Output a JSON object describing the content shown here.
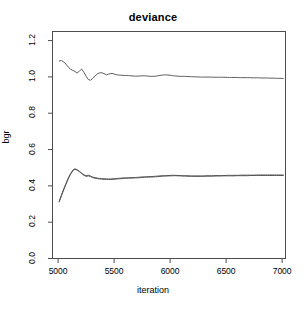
{
  "chart_data": {
    "type": "line",
    "title": "deviance",
    "xlabel": "iteration",
    "ylabel": "bgr",
    "xlim": [
      4950,
      7030
    ],
    "ylim": [
      0.0,
      1.25
    ],
    "grid": false,
    "legend": "none",
    "xticks": [
      5000,
      5500,
      6000,
      6500,
      7000
    ],
    "xtick_labels": [
      "5000",
      "5500",
      "6000",
      "6500",
      "7000"
    ],
    "yticks": [
      0.0,
      0.2,
      0.4,
      0.6,
      0.8,
      1.0,
      1.2
    ],
    "ytick_labels": [
      "0.0",
      "0.2",
      "0.4",
      "0.6",
      "0.8",
      "1.0",
      "1.2"
    ],
    "line_color": "#4d4d4d",
    "axis_color": "#4d4d4d",
    "series": [
      {
        "name": "upper-trace",
        "x": [
          5010,
          5030,
          5050,
          5070,
          5090,
          5110,
          5130,
          5150,
          5170,
          5190,
          5210,
          5230,
          5250,
          5270,
          5290,
          5310,
          5330,
          5350,
          5370,
          5390,
          5410,
          5430,
          5450,
          5470,
          5490,
          5510,
          5530,
          5550,
          5570,
          5590,
          5610,
          5630,
          5650,
          5670,
          5690,
          5710,
          5730,
          5750,
          5770,
          5790,
          5810,
          5830,
          5850,
          5870,
          5890,
          5910,
          5930,
          5950,
          5970,
          5990,
          6010,
          6030,
          6050,
          6070,
          6090,
          6110,
          6130,
          6150,
          6170,
          6190,
          6210,
          6230,
          6250,
          6270,
          6290,
          6310,
          6330,
          6350,
          6370,
          6390,
          6410,
          6430,
          6450,
          6470,
          6490,
          6510,
          6530,
          6550,
          6570,
          6590,
          6610,
          6630,
          6650,
          6670,
          6690,
          6710,
          6730,
          6750,
          6770,
          6790,
          6810,
          6830,
          6850,
          6870,
          6890,
          6910,
          6930,
          6950,
          6970,
          6990,
          7010
        ],
        "values": [
          1.088,
          1.09,
          1.083,
          1.07,
          1.055,
          1.043,
          1.036,
          1.03,
          1.021,
          1.032,
          1.043,
          1.026,
          1.004,
          0.985,
          0.982,
          0.992,
          1.006,
          1.016,
          1.022,
          1.023,
          1.018,
          1.012,
          1.015,
          1.019,
          1.018,
          1.014,
          1.011,
          1.01,
          1.009,
          1.008,
          1.008,
          1.007,
          1.006,
          1.005,
          1.004,
          1.004,
          1.005,
          1.006,
          1.006,
          1.005,
          1.004,
          1.003,
          1.003,
          1.004,
          1.006,
          1.008,
          1.01,
          1.011,
          1.011,
          1.01,
          1.008,
          1.006,
          1.005,
          1.004,
          1.003,
          1.003,
          1.003,
          1.002,
          1.002,
          1.001,
          1.001,
          1.0,
          1.0,
          0.999,
          0.999,
          0.999,
          0.999,
          0.999,
          0.999,
          0.998,
          0.998,
          0.998,
          0.998,
          0.998,
          0.998,
          0.997,
          0.997,
          0.997,
          0.997,
          0.997,
          0.996,
          0.996,
          0.996,
          0.996,
          0.996,
          0.996,
          0.995,
          0.995,
          0.995,
          0.995,
          0.994,
          0.994,
          0.994,
          0.994,
          0.993,
          0.993,
          0.993,
          0.992,
          0.992,
          0.992,
          0.991
        ]
      },
      {
        "name": "lower-trace-a",
        "x": [
          5010,
          5030,
          5050,
          5070,
          5090,
          5110,
          5130,
          5150,
          5170,
          5190,
          5210,
          5230,
          5250,
          5270,
          5290,
          5310,
          5330,
          5350,
          5370,
          5390,
          5410,
          5430,
          5450,
          5470,
          5490,
          5510,
          5530,
          5550,
          5570,
          5590,
          5610,
          5630,
          5650,
          5670,
          5690,
          5710,
          5730,
          5750,
          5770,
          5790,
          5810,
          5830,
          5850,
          5870,
          5890,
          5910,
          5930,
          5950,
          5970,
          5990,
          6010,
          6030,
          6050,
          6070,
          6090,
          6110,
          6130,
          6150,
          6170,
          6190,
          6210,
          6230,
          6250,
          6270,
          6290,
          6310,
          6330,
          6350,
          6370,
          6390,
          6410,
          6430,
          6450,
          6470,
          6490,
          6510,
          6530,
          6550,
          6570,
          6590,
          6610,
          6630,
          6650,
          6670,
          6690,
          6710,
          6730,
          6750,
          6770,
          6790,
          6810,
          6830,
          6850,
          6870,
          6890,
          6910,
          6930,
          6950,
          6970,
          6990,
          7010
        ],
        "values": [
          0.312,
          0.345,
          0.378,
          0.408,
          0.438,
          0.462,
          0.482,
          0.491,
          0.487,
          0.478,
          0.468,
          0.458,
          0.452,
          0.455,
          0.451,
          0.445,
          0.442,
          0.44,
          0.438,
          0.437,
          0.436,
          0.436,
          0.435,
          0.435,
          0.436,
          0.437,
          0.438,
          0.439,
          0.44,
          0.441,
          0.442,
          0.442,
          0.443,
          0.443,
          0.444,
          0.444,
          0.445,
          0.446,
          0.447,
          0.448,
          0.448,
          0.449,
          0.449,
          0.45,
          0.451,
          0.452,
          0.453,
          0.454,
          0.454,
          0.455,
          0.455,
          0.456,
          0.456,
          0.455,
          0.455,
          0.454,
          0.454,
          0.453,
          0.453,
          0.452,
          0.452,
          0.452,
          0.452,
          0.452,
          0.452,
          0.453,
          0.453,
          0.453,
          0.453,
          0.454,
          0.454,
          0.454,
          0.454,
          0.455,
          0.455,
          0.455,
          0.455,
          0.455,
          0.455,
          0.456,
          0.456,
          0.456,
          0.456,
          0.456,
          0.456,
          0.457,
          0.457,
          0.457,
          0.457,
          0.457,
          0.457,
          0.457,
          0.457,
          0.457,
          0.457,
          0.457,
          0.457,
          0.457,
          0.457,
          0.457,
          0.457
        ]
      },
      {
        "name": "lower-trace-b",
        "x": [
          5010,
          5030,
          5050,
          5070,
          5090,
          5110,
          5130,
          5150,
          5170,
          5190,
          5210,
          5230,
          5250,
          5270,
          5290,
          5310,
          5330,
          5350,
          5370,
          5390,
          5410,
          5430,
          5450,
          5470,
          5490,
          5510,
          5530,
          5550,
          5570,
          5590,
          5610,
          5630,
          5650,
          5670,
          5690,
          5710,
          5730,
          5750,
          5770,
          5790,
          5810,
          5830,
          5850,
          5870,
          5890,
          5910,
          5930,
          5950,
          5970,
          5990,
          6010,
          6030,
          6050,
          6070,
          6090,
          6110,
          6130,
          6150,
          6170,
          6190,
          6210,
          6230,
          6250,
          6270,
          6290,
          6310,
          6330,
          6350,
          6370,
          6390,
          6410,
          6430,
          6450,
          6470,
          6490,
          6510,
          6530,
          6550,
          6570,
          6590,
          6610,
          6630,
          6650,
          6670,
          6690,
          6710,
          6730,
          6750,
          6770,
          6790,
          6810,
          6830,
          6850,
          6870,
          6890,
          6910,
          6930,
          6950,
          6970,
          6990,
          7010
        ],
        "values": [
          0.316,
          0.35,
          0.383,
          0.413,
          0.442,
          0.466,
          0.486,
          0.494,
          0.489,
          0.48,
          0.47,
          0.461,
          0.456,
          0.459,
          0.454,
          0.448,
          0.445,
          0.443,
          0.441,
          0.44,
          0.439,
          0.438,
          0.438,
          0.438,
          0.439,
          0.44,
          0.441,
          0.442,
          0.443,
          0.444,
          0.444,
          0.445,
          0.445,
          0.446,
          0.446,
          0.447,
          0.448,
          0.449,
          0.45,
          0.45,
          0.451,
          0.451,
          0.452,
          0.453,
          0.454,
          0.455,
          0.456,
          0.456,
          0.457,
          0.457,
          0.458,
          0.458,
          0.458,
          0.457,
          0.457,
          0.456,
          0.456,
          0.456,
          0.455,
          0.455,
          0.455,
          0.455,
          0.455,
          0.455,
          0.455,
          0.455,
          0.456,
          0.456,
          0.456,
          0.456,
          0.457,
          0.457,
          0.457,
          0.457,
          0.457,
          0.458,
          0.458,
          0.458,
          0.458,
          0.458,
          0.458,
          0.459,
          0.459,
          0.459,
          0.459,
          0.459,
          0.459,
          0.459,
          0.46,
          0.46,
          0.46,
          0.46,
          0.46,
          0.46,
          0.46,
          0.46,
          0.46,
          0.46,
          0.46,
          0.46,
          0.46
        ]
      }
    ]
  }
}
